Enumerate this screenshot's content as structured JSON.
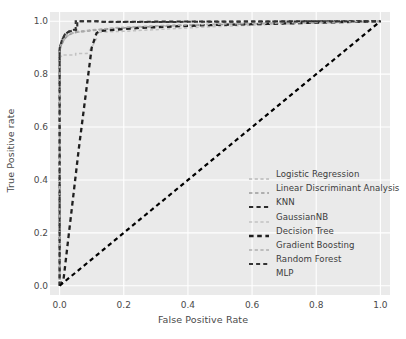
{
  "chart_data": {
    "type": "line",
    "title": "",
    "xlabel": "False Positive Rate",
    "ylabel": "True Positive rate",
    "xlim": [
      -0.03,
      1.03
    ],
    "ylim": [
      -0.035,
      1.035
    ],
    "xticks": [
      "0.0",
      "0.2",
      "0.4",
      "0.6",
      "0.8",
      "1.0"
    ],
    "xtick_values": [
      0.0,
      0.2,
      0.4,
      0.6,
      0.8,
      1.0
    ],
    "yticks": [
      "0.0",
      "0.2",
      "0.4",
      "0.6",
      "0.8",
      "1.0"
    ],
    "ytick_values": [
      0.0,
      0.2,
      0.4,
      0.6,
      0.8,
      1.0
    ],
    "grid": true,
    "legend_position": "lower right",
    "background": "#eaeaea",
    "gridline_color": "#ffffff",
    "series": [
      {
        "name": "Logistic Regression",
        "color": "#b9b9b9",
        "linestyle": "dashed",
        "linewidth": 1.5,
        "x": [
          0.0,
          0.0,
          0.004,
          0.012,
          0.02,
          0.035,
          0.05,
          0.08,
          0.12,
          0.16,
          0.3,
          0.5,
          0.7,
          0.85,
          1.0
        ],
        "y": [
          0.0,
          0.895,
          0.908,
          0.925,
          0.94,
          0.952,
          0.958,
          0.962,
          0.968,
          0.972,
          0.982,
          0.988,
          0.992,
          0.996,
          1.0
        ]
      },
      {
        "name": "Linear Discriminant Analysis",
        "color": "#9a9a9a",
        "linestyle": "dashed",
        "linewidth": 1.7,
        "x": [
          0.0,
          0.0,
          0.006,
          0.014,
          0.024,
          0.04,
          0.06,
          0.1,
          0.14,
          0.2,
          0.35,
          0.55,
          0.75,
          0.9,
          1.0
        ],
        "y": [
          0.0,
          0.888,
          0.912,
          0.93,
          0.945,
          0.955,
          0.96,
          0.965,
          0.97,
          0.975,
          0.983,
          0.989,
          0.993,
          0.997,
          1.0
        ]
      },
      {
        "name": "KNN",
        "color": "#2c2c2c",
        "linestyle": "dashed",
        "linewidth": 2.1,
        "x": [
          0.0,
          0.0,
          0.008,
          0.018,
          0.03,
          0.045,
          0.055,
          0.055,
          0.12,
          0.13,
          0.2,
          0.4,
          0.6,
          0.8,
          1.0
        ],
        "y": [
          0.0,
          0.9,
          0.93,
          0.952,
          0.962,
          0.968,
          0.968,
          1.0,
          1.0,
          0.998,
          0.998,
          0.999,
          0.999,
          1.0,
          1.0
        ]
      },
      {
        "name": "GaussianNB",
        "color": "#c2c2c2",
        "linestyle": "dashed",
        "linewidth": 1.5,
        "x": [
          0.0,
          0.0,
          0.006,
          0.012,
          0.012,
          0.05,
          0.05,
          0.085,
          0.1,
          0.115,
          0.115,
          0.2,
          0.45,
          0.7,
          1.0
        ],
        "y": [
          0.0,
          0.862,
          0.868,
          0.868,
          0.872,
          0.872,
          0.878,
          0.878,
          0.9,
          0.935,
          0.958,
          0.962,
          0.978,
          0.99,
          1.0
        ]
      },
      {
        "name": "Decision Tree",
        "color": "#1f1f1f",
        "linestyle": "dashed",
        "linewidth": 2.3,
        "x": [
          0.0,
          0.012,
          0.06,
          0.1,
          0.115,
          0.125,
          0.14,
          0.25,
          0.45,
          0.65,
          0.85,
          1.0
        ],
        "y": [
          0.0,
          0.022,
          0.52,
          0.9,
          0.955,
          0.963,
          0.965,
          0.975,
          0.985,
          0.99,
          0.996,
          1.0
        ]
      },
      {
        "name": "Gradient Boosting",
        "color": "#aeaeae",
        "linestyle": "dashed",
        "linewidth": 1.6,
        "x": [
          0.0,
          0.0,
          0.005,
          0.013,
          0.022,
          0.038,
          0.055,
          0.09,
          0.13,
          0.18,
          0.32,
          0.52,
          0.72,
          0.88,
          1.0
        ],
        "y": [
          0.0,
          0.892,
          0.915,
          0.932,
          0.948,
          0.956,
          0.961,
          0.966,
          0.97,
          0.976,
          0.984,
          0.99,
          0.994,
          0.997,
          1.0
        ]
      },
      {
        "name": "Random Forest",
        "color": "#343434",
        "linestyle": "dashed",
        "linewidth": 2.0,
        "x": [
          0.0,
          0.0,
          0.007,
          0.016,
          0.028,
          0.042,
          0.05,
          0.05,
          0.115,
          0.135,
          0.25,
          0.45,
          0.65,
          0.85,
          1.0
        ],
        "y": [
          0.0,
          0.898,
          0.928,
          0.95,
          0.96,
          0.966,
          0.966,
          1.0,
          1.0,
          0.997,
          0.997,
          0.998,
          0.999,
          1.0,
          1.0
        ]
      },
      {
        "name": "MLP",
        "color": "#000000",
        "linestyle": "dashed",
        "linewidth": 2.2,
        "x": [
          0.0,
          1.0
        ],
        "y": [
          0.0,
          1.0
        ]
      }
    ]
  }
}
